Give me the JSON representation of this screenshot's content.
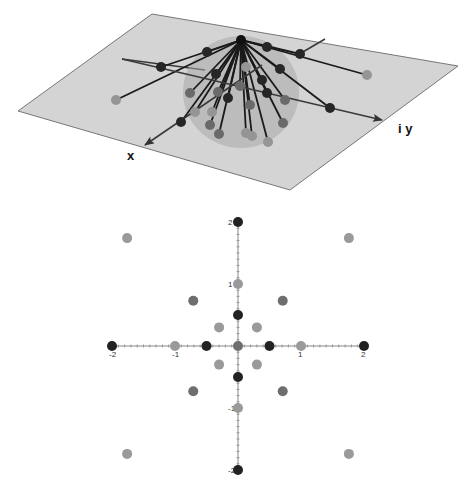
{
  "top_figure": {
    "type": "3d-diagram",
    "plane_color": "#d4d4d4",
    "plane_edge_color": "#777777",
    "sphere_color": "#a8a8a8",
    "axis_labels": {
      "x": "x",
      "y": "i y"
    },
    "apex": [
      241,
      40
    ],
    "plane_corners": [
      [
        18,
        111
      ],
      [
        152,
        14
      ],
      [
        458,
        66
      ],
      [
        290,
        190
      ]
    ],
    "axes": {
      "x_axis": {
        "from": [
          262,
          65
        ],
        "to": [
          145,
          145
        ]
      },
      "y_axis": {
        "from": [
          122,
          59
        ],
        "to": [
          382,
          120
        ]
      },
      "grid_line_1": {
        "from": [
          122,
          59
        ],
        "to": [
          205,
          70
        ]
      },
      "grid_line_2": {
        "from": [
          325,
          39
        ],
        "to": [
          296,
          56
        ]
      }
    },
    "balls": [
      {
        "x": 207,
        "y": 52,
        "shade": "dark"
      },
      {
        "x": 161,
        "y": 67,
        "shade": "dark"
      },
      {
        "x": 116,
        "y": 100,
        "shade": "light"
      },
      {
        "x": 267,
        "y": 47,
        "shade": "dark"
      },
      {
        "x": 300,
        "y": 54,
        "shade": "dark"
      },
      {
        "x": 367,
        "y": 75,
        "shade": "light"
      },
      {
        "x": 280,
        "y": 69,
        "shade": "dark"
      },
      {
        "x": 216,
        "y": 74,
        "shade": "dark"
      },
      {
        "x": 246,
        "y": 67,
        "shade": "light"
      },
      {
        "x": 240,
        "y": 86,
        "shade": "medium"
      },
      {
        "x": 218,
        "y": 92,
        "shade": "medium"
      },
      {
        "x": 190,
        "y": 93,
        "shade": "medium"
      },
      {
        "x": 262,
        "y": 80,
        "shade": "dark"
      },
      {
        "x": 330,
        "y": 108,
        "shade": "dark"
      },
      {
        "x": 181,
        "y": 122,
        "shade": "dark"
      },
      {
        "x": 228,
        "y": 98,
        "shade": "dark"
      },
      {
        "x": 267,
        "y": 93,
        "shade": "dark"
      },
      {
        "x": 285,
        "y": 100,
        "shade": "medium"
      },
      {
        "x": 210,
        "y": 125,
        "shade": "medium"
      },
      {
        "x": 219,
        "y": 134,
        "shade": "medium"
      },
      {
        "x": 246,
        "y": 133,
        "shade": "light"
      },
      {
        "x": 252,
        "y": 136,
        "shade": "light"
      },
      {
        "x": 268,
        "y": 142,
        "shade": "light"
      },
      {
        "x": 283,
        "y": 123,
        "shade": "medium"
      },
      {
        "x": 195,
        "y": 112,
        "shade": "light"
      },
      {
        "x": 250,
        "y": 105,
        "shade": "medium"
      },
      {
        "x": 212,
        "y": 112,
        "shade": "light"
      }
    ]
  },
  "chart_data": {
    "type": "scatter",
    "title": "",
    "xlabel": "",
    "ylabel": "",
    "xlim": [
      -2,
      2
    ],
    "ylim": [
      -2,
      2
    ],
    "grid": false,
    "x_tick_labels": [
      "-2",
      "-1",
      "1",
      "2"
    ],
    "y_tick_labels": [
      "2",
      "1",
      "-1",
      "-2"
    ],
    "colors": {
      "dark": "#222222",
      "medium": "#6e6e6e",
      "light": "#9a9a9a"
    },
    "points": [
      {
        "x": 0,
        "y": 2,
        "shade": "dark"
      },
      {
        "x": 0,
        "y": -2,
        "shade": "dark"
      },
      {
        "x": -2,
        "y": 0,
        "shade": "dark"
      },
      {
        "x": 2,
        "y": 0,
        "shade": "dark"
      },
      {
        "x": -0.5,
        "y": 0,
        "shade": "dark"
      },
      {
        "x": 0.5,
        "y": 0,
        "shade": "dark"
      },
      {
        "x": 0,
        "y": 0.5,
        "shade": "dark"
      },
      {
        "x": 0,
        "y": -0.5,
        "shade": "dark"
      },
      {
        "x": -1,
        "y": 0,
        "shade": "light"
      },
      {
        "x": 1,
        "y": 0,
        "shade": "light"
      },
      {
        "x": 0,
        "y": 1,
        "shade": "light"
      },
      {
        "x": 0,
        "y": -1,
        "shade": "light"
      },
      {
        "x": 0,
        "y": 0,
        "shade": "medium"
      },
      {
        "x": -0.71,
        "y": 0.73,
        "shade": "medium"
      },
      {
        "x": 0.71,
        "y": 0.73,
        "shade": "medium"
      },
      {
        "x": -0.71,
        "y": -0.73,
        "shade": "medium"
      },
      {
        "x": 0.71,
        "y": -0.73,
        "shade": "medium"
      },
      {
        "x": -0.3,
        "y": 0.3,
        "shade": "light"
      },
      {
        "x": 0.3,
        "y": 0.3,
        "shade": "light"
      },
      {
        "x": -0.3,
        "y": -0.3,
        "shade": "light"
      },
      {
        "x": 0.3,
        "y": -0.3,
        "shade": "light"
      },
      {
        "x": -1.76,
        "y": 1.74,
        "shade": "light"
      },
      {
        "x": 1.76,
        "y": 1.74,
        "shade": "light"
      },
      {
        "x": -1.76,
        "y": -1.74,
        "shade": "light"
      },
      {
        "x": 1.76,
        "y": -1.74,
        "shade": "light"
      }
    ]
  }
}
